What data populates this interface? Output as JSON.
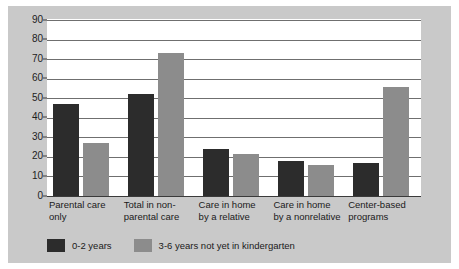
{
  "chart_data": {
    "type": "bar",
    "title": "",
    "subtitle": "",
    "xlabel": "",
    "ylabel": "",
    "ylim": [
      0,
      90
    ],
    "ytick_step": 10,
    "yticks": [
      "90",
      "80",
      "70",
      "60",
      "50",
      "40",
      "30",
      "20",
      "10",
      "0"
    ],
    "grid": true,
    "legend_position": "bottom-left",
    "categories": [
      "Parental care\nonly",
      "Total in non-\nparental care",
      "Care in home\nby a relative",
      "Care in home\nby a nonrelative",
      "Center-based\nprograms"
    ],
    "series": [
      {
        "name": "0-2 years",
        "color": "#2c2c2c",
        "values": [
          47,
          52,
          24,
          18,
          17
        ]
      },
      {
        "name": "3-6 years not yet in kindergarten",
        "color": "#8c8c8c",
        "values": [
          27,
          73,
          21.5,
          16,
          56
        ]
      }
    ]
  },
  "colors": {
    "figure_background": "#c9c9c9",
    "plot_background": "#ffffff",
    "gridline": "#6f6f6f",
    "axis": "#3a3a3a",
    "text": "#1a1a1a"
  }
}
